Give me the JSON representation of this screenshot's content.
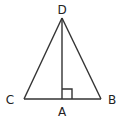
{
  "diagram": {
    "type": "geometry",
    "stroke_color": "#333333",
    "points": {
      "D": {
        "label": "D",
        "x": 62,
        "y": 18
      },
      "C": {
        "label": "C",
        "x": 24,
        "y": 99
      },
      "B": {
        "label": "B",
        "x": 101,
        "y": 99
      },
      "A": {
        "label": "A",
        "x": 62,
        "y": 99
      }
    },
    "segments": [
      {
        "from": "D",
        "to": "C"
      },
      {
        "from": "D",
        "to": "B"
      },
      {
        "from": "C",
        "to": "B"
      },
      {
        "from": "D",
        "to": "A"
      }
    ],
    "right_angle_marker": {
      "at": "A",
      "size": 10
    },
    "labels": {
      "D": "D",
      "C": "C",
      "B": "B",
      "A": "A"
    }
  }
}
